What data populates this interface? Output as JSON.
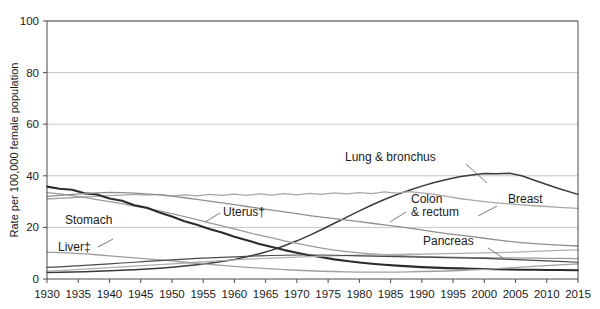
{
  "chart_data": {
    "type": "line",
    "title": "",
    "subtitle": "",
    "xlabel": "",
    "ylabel": "Rate per 100,000 female population",
    "xlim": [
      1930,
      2015
    ],
    "ylim": [
      0,
      100
    ],
    "grid": true,
    "gridlines_y": [
      20,
      40,
      60,
      80,
      100
    ],
    "legend_position": "inline-annotations",
    "yticks": [
      0,
      20,
      40,
      60,
      80,
      100
    ],
    "ytick_labels": [
      "0",
      "20",
      "40",
      "60",
      "80",
      "100"
    ],
    "xticks": [
      1930,
      1935,
      1940,
      1945,
      1950,
      1955,
      1960,
      1965,
      1970,
      1975,
      1980,
      1985,
      1990,
      1995,
      2000,
      2005,
      2010,
      2015
    ],
    "xtick_labels": [
      "1930",
      "1935",
      "1940",
      "1945",
      "1950",
      "1955",
      "1960",
      "1965",
      "1970",
      "1975",
      "1980",
      "1985",
      "1990",
      "1995",
      "2000",
      "2005",
      "2010",
      "2015"
    ],
    "x": [
      1930,
      1932,
      1934,
      1936,
      1938,
      1940,
      1942,
      1944,
      1946,
      1948,
      1950,
      1952,
      1954,
      1956,
      1958,
      1960,
      1962,
      1964,
      1966,
      1968,
      1970,
      1972,
      1974,
      1976,
      1978,
      1980,
      1982,
      1984,
      1986,
      1988,
      1990,
      1992,
      1994,
      1996,
      1998,
      2000,
      2002,
      2004,
      2006,
      2008,
      2010,
      2012,
      2015
    ],
    "series": [
      {
        "name": "Lung & bronchus",
        "color": "#3a3a3a",
        "width": 1.5,
        "label_x": 1988,
        "label_y": 58,
        "values": [
          2.5,
          2.6,
          2.7,
          2.8,
          3.0,
          3.2,
          3.4,
          3.6,
          3.9,
          4.2,
          4.6,
          5.0,
          5.5,
          6.1,
          6.8,
          7.6,
          8.6,
          9.8,
          11.2,
          12.9,
          14.8,
          16.9,
          19.2,
          21.6,
          24.0,
          26.4,
          28.7,
          30.8,
          32.7,
          34.4,
          36.0,
          37.4,
          38.6,
          39.6,
          40.3,
          40.9,
          40.8,
          41.0,
          40.0,
          38.3,
          36.6,
          35.0,
          32.8
        ]
      },
      {
        "name": "Breast",
        "color": "#a8a8a8",
        "width": 1.3,
        "label_x": 2003,
        "label_y": 27,
        "values": [
          31.0,
          31.3,
          31.5,
          31.8,
          32.0,
          32.3,
          32.5,
          32.8,
          32.5,
          32.8,
          32.2,
          32.6,
          32.2,
          32.8,
          32.4,
          32.9,
          32.4,
          33.0,
          32.5,
          33.1,
          32.6,
          33.2,
          32.8,
          33.4,
          33.0,
          33.5,
          33.1,
          33.8,
          33.3,
          33.9,
          33.4,
          32.8,
          32.0,
          31.2,
          30.6,
          30.0,
          29.5,
          29.1,
          28.7,
          28.4,
          28.1,
          27.8,
          27.4
        ]
      },
      {
        "name": "Uterus†",
        "color": "#9a9a9a",
        "width": 1.3,
        "label_x": 1952,
        "label_y": 22,
        "values": [
          33.5,
          33.0,
          32.3,
          31.6,
          30.8,
          30.0,
          29.2,
          28.3,
          27.4,
          26.4,
          25.3,
          24.2,
          23.0,
          21.8,
          20.6,
          19.4,
          18.2,
          17.0,
          15.9,
          14.8,
          13.8,
          12.8,
          12.0,
          11.2,
          10.6,
          10.1,
          9.7,
          9.4,
          9.1,
          8.9,
          8.7,
          8.6,
          8.5,
          8.4,
          8.3,
          8.3,
          8.2,
          8.2,
          8.1,
          8.1,
          8.0,
          8.0,
          7.9
        ]
      },
      {
        "name": "Stomach",
        "color": "#2b2b2b",
        "width": 2.1,
        "label_x": 1938,
        "label_y": 24,
        "values": [
          35.8,
          35.0,
          34.6,
          33.2,
          32.8,
          31.2,
          30.3,
          28.6,
          27.6,
          25.8,
          24.2,
          22.4,
          21.0,
          19.4,
          18.0,
          16.4,
          15.0,
          13.6,
          12.4,
          11.2,
          10.2,
          9.2,
          8.4,
          7.6,
          7.0,
          6.4,
          5.9,
          5.5,
          5.2,
          4.9,
          4.6,
          4.4,
          4.2,
          4.1,
          4.0,
          3.9,
          3.8,
          3.7,
          3.6,
          3.6,
          3.5,
          3.5,
          3.4
        ]
      },
      {
        "name": "Colon & rectum",
        "color": "#8f8f8f",
        "width": 1.3,
        "label_x": 1980,
        "label_y": 30,
        "values": [
          32.0,
          32.4,
          32.8,
          33.1,
          33.4,
          33.6,
          33.5,
          33.3,
          33.0,
          32.6,
          32.1,
          31.5,
          30.9,
          30.2,
          29.5,
          28.8,
          28.1,
          27.4,
          26.7,
          26.0,
          25.3,
          24.6,
          24.0,
          23.4,
          22.8,
          22.2,
          21.6,
          21.0,
          20.4,
          19.7,
          19.0,
          18.3,
          17.6,
          17.0,
          16.4,
          15.8,
          15.2,
          14.6,
          14.1,
          13.7,
          13.4,
          13.1,
          12.8
        ]
      },
      {
        "name": "Pancreas",
        "color": "#b0b0b0",
        "width": 1.3,
        "label_x": 1988,
        "label_y": 17,
        "values": [
          3.0,
          3.2,
          3.5,
          3.8,
          4.1,
          4.4,
          4.7,
          5.0,
          5.3,
          5.6,
          5.9,
          6.2,
          6.5,
          6.8,
          7.1,
          7.4,
          7.7,
          7.9,
          8.1,
          8.3,
          8.5,
          8.7,
          8.9,
          9.0,
          9.1,
          9.2,
          9.3,
          9.4,
          9.5,
          9.6,
          9.6,
          9.7,
          9.8,
          9.9,
          10.0,
          10.1,
          10.2,
          10.3,
          10.5,
          10.7,
          10.9,
          11.1,
          11.3
        ]
      },
      {
        "name": "Liver‡",
        "color": "#9e9e9e",
        "width": 1.3,
        "label_x": 1934,
        "label_y": 13,
        "values": [
          10.4,
          10.2,
          10.0,
          9.7,
          9.4,
          9.0,
          8.6,
          8.2,
          7.8,
          7.4,
          7.0,
          6.5,
          6.1,
          5.7,
          5.3,
          4.9,
          4.5,
          4.2,
          3.9,
          3.6,
          3.4,
          3.2,
          3.0,
          2.9,
          2.8,
          2.7,
          2.7,
          2.7,
          2.7,
          2.8,
          2.9,
          3.0,
          3.1,
          3.3,
          3.5,
          3.7,
          4.0,
          4.3,
          4.6,
          4.9,
          5.2,
          5.5,
          5.9
        ]
      },
      {
        "name": "Ovary",
        "color": "#4a4a4a",
        "width": 1.2,
        "label_x": null,
        "label_y": null,
        "values": [
          4.5,
          4.7,
          5.0,
          5.3,
          5.6,
          5.9,
          6.2,
          6.5,
          6.8,
          7.1,
          7.4,
          7.7,
          8.0,
          8.2,
          8.4,
          8.6,
          8.8,
          9.0,
          9.1,
          9.2,
          9.3,
          9.3,
          9.3,
          9.2,
          9.1,
          9.0,
          8.9,
          8.8,
          8.7,
          8.6,
          8.5,
          8.4,
          8.3,
          8.2,
          8.1,
          8.0,
          7.8,
          7.6,
          7.4,
          7.2,
          7.0,
          6.8,
          6.5
        ]
      }
    ],
    "annotations": [
      {
        "text": "Lung & bronchus",
        "x_px": 345,
        "y_px": 161,
        "leader": "M 466,164 L 487,183"
      },
      {
        "text": "Breast",
        "x_px": 508,
        "y_px": 203,
        "leader": "M 497,206 L 478,216"
      },
      {
        "text": "Colon",
        "x_px": 411,
        "y_px": 203
      },
      {
        "text": "& rectum",
        "x_px": 411,
        "y_px": 216,
        "leader": "M 406,212 L 390,222"
      },
      {
        "text": "Pancreas",
        "x_px": 423,
        "y_px": 245,
        "leader": "M 488,248 L 503,258"
      },
      {
        "text": "Uterus†",
        "x_px": 223,
        "y_px": 216,
        "leader": "M 220,213 L 205,222"
      },
      {
        "text": "Stomach",
        "x_px": 65,
        "y_px": 224
      },
      {
        "text": "Liver‡",
        "x_px": 58,
        "y_px": 251,
        "leader": "M 98,247 L 113,239"
      }
    ]
  }
}
